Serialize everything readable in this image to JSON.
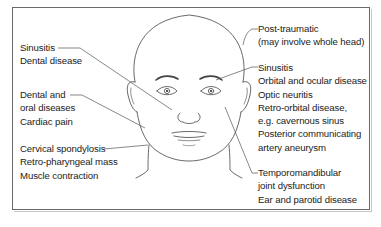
{
  "diagram": {
    "left_labels": [
      {
        "id": "sinus-dental",
        "lines": [
          "Sinusitis",
          "Dental disease"
        ]
      },
      {
        "id": "dental-oral-cardiac",
        "lines": [
          "Dental and",
          "oral diseases",
          "Cardiac pain"
        ]
      },
      {
        "id": "cervical",
        "lines": [
          "Cervical spondylosis",
          "Retro-pharyngeal mass",
          "Muscle contraction"
        ]
      }
    ],
    "right_labels": [
      {
        "id": "post-traumatic",
        "lines": [
          "Post-traumatic",
          "(may involve whole head)"
        ]
      },
      {
        "id": "orbital",
        "lines": [
          "Sinusitis",
          "Orbital and ocular disease",
          "Optic neuritis",
          "Retro-orbital disease,",
          "e.g. cavernous sinus",
          "Posterior communicating",
          "artery aneurysm"
        ]
      },
      {
        "id": "tmj",
        "lines": [
          "Temporomandibular",
          "joint dysfunction",
          "Ear and parotid disease"
        ]
      }
    ],
    "colors": {
      "line": "#555555",
      "text": "#222222",
      "frame": "#6a6a6a"
    }
  }
}
